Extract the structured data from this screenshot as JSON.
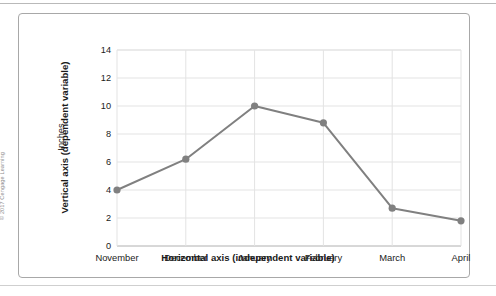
{
  "attribution": "© 2017 Cengage Learning",
  "chart_data": {
    "type": "line",
    "title": "",
    "xlabel": "Horizontal axis (independent variable)",
    "ylabel": "Vertical axis (dependent variable)",
    "yunits": "Inches",
    "categories": [
      "November",
      "December",
      "January",
      "February",
      "March",
      "April"
    ],
    "values": [
      4.0,
      6.2,
      10.0,
      8.8,
      2.7,
      1.8
    ],
    "yticks": [
      0,
      2,
      4,
      6,
      8,
      10,
      12,
      14
    ],
    "ylim": [
      0,
      14
    ],
    "grid": "horizontal-and-vertical",
    "legend": "none",
    "series_color": "#808080",
    "marker": "circle",
    "gridline_color": "#e3e3e3",
    "axis_color": "#b0b0b0"
  }
}
